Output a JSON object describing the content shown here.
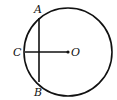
{
  "diagram": {
    "type": "circle-geometry",
    "circle": {
      "center": "O",
      "cx": 68,
      "cy": 52,
      "r": 44
    },
    "points": {
      "A": {
        "label": "A",
        "x": 39,
        "y": 20
      },
      "B": {
        "label": "B",
        "x": 39,
        "y": 82
      },
      "C": {
        "label": "C",
        "x": 25,
        "y": 52
      },
      "O": {
        "label": "O",
        "x": 68,
        "y": 52
      }
    },
    "segments": [
      {
        "from": "A",
        "to": "B",
        "name": "chord AB"
      },
      {
        "from": "C",
        "to": "O",
        "name": "radius OC"
      }
    ],
    "colors": {
      "stroke": "#111111",
      "background": "#ffffff"
    }
  }
}
